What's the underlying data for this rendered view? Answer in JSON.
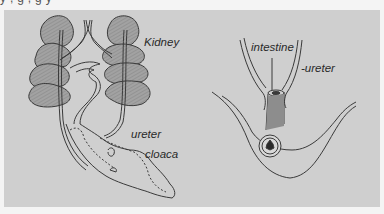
{
  "figure": {
    "top_caption_fragment": "y ,            g  ,                   g  y",
    "panel_color": "#cfcfcf",
    "page_color": "#f4f4f4",
    "ink_color": "#3a3a3a",
    "organ_fill": "#9a9a9a",
    "left_diagram": {
      "labels": {
        "kidney": "Kidney",
        "ureter": "ureter",
        "cloaca": "cloaca"
      }
    },
    "right_diagram": {
      "labels": {
        "intestine": "intestine",
        "ureter": "-ureter"
      }
    }
  }
}
